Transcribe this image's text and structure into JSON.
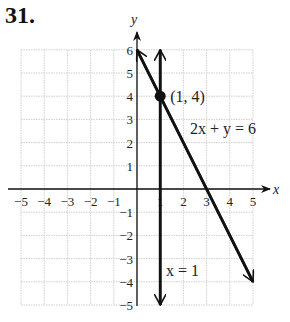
{
  "problem": {
    "number": "31."
  },
  "chart_data": {
    "type": "line",
    "title": "",
    "xlabel": "x",
    "ylabel": "y",
    "xlim": [
      -5,
      5
    ],
    "ylim": [
      -5,
      6
    ],
    "grid": true,
    "x_ticks": [
      "−5",
      "−4",
      "−3",
      "−2",
      "−1",
      "1",
      "2",
      "3",
      "4",
      "5"
    ],
    "y_ticks": [
      "6",
      "5",
      "4",
      "3",
      "2",
      "1",
      "−1",
      "−2",
      "−3",
      "−4",
      "−5"
    ],
    "series": [
      {
        "name": "2x + y = 6",
        "points": [
          [
            0,
            6
          ],
          [
            5,
            -4
          ]
        ],
        "label": "2x + y = 6"
      },
      {
        "name": "x = 1",
        "points": [
          [
            1,
            6
          ],
          [
            1,
            -5
          ]
        ],
        "label": "x = 1"
      }
    ],
    "annotations": [
      {
        "text": "(1, 4)",
        "point": [
          1,
          4
        ]
      }
    ]
  }
}
